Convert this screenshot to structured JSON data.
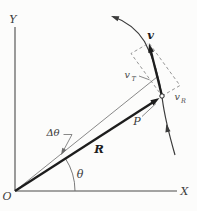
{
  "diagram": {
    "type": "physics-vector-diagram",
    "colors": {
      "background": "#fcfcfb",
      "axis": "#4a4a4a",
      "bold_vector": "#1d1d1d",
      "thin_line": "#6b6b6b",
      "dashed_line": "#7a7a7a",
      "curve": "#3b3b3b",
      "text": "#3a3a3a"
    },
    "labels": {
      "y_axis": "Y",
      "x_axis": "X",
      "origin": "O",
      "radius_vector": "R",
      "velocity_vector": "v",
      "angle_theta": "θ",
      "angle_delta_theta": "Δθ",
      "point": "P",
      "transverse_component": {
        "main": "v",
        "sub": "T"
      },
      "radial_component": {
        "main": "v",
        "sub": "R"
      }
    }
  }
}
